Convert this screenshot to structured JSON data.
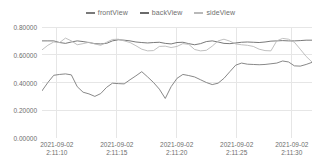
{
  "legend": {
    "position": "top-center",
    "items": [
      {
        "label": "frontView",
        "color": "#7a7a7a",
        "icon": "line-swatch-icon"
      },
      {
        "label": "backView",
        "color": "#6a6a6a",
        "icon": "line-swatch-icon"
      },
      {
        "label": "sideView",
        "color": "#b9b9b9",
        "icon": "line-swatch-icon"
      }
    ]
  },
  "axes": {
    "y_ticks": [
      "0.80000",
      "0.60000",
      "0.40000",
      "0.20000",
      "0.00000"
    ],
    "y_values": [
      0.8,
      0.6,
      0.4,
      0.2,
      0.0
    ],
    "x_ticks": [
      {
        "date": "2021-09-02",
        "time": "2:11:10"
      },
      {
        "date": "2021-09-02",
        "time": "2:11:15"
      },
      {
        "date": "2021-09-02",
        "time": "2:11:20"
      },
      {
        "date": "2021-09-02",
        "time": "2:11:25"
      },
      {
        "date": "2021-09-02",
        "time": "2:11:30"
      }
    ]
  },
  "style": {
    "grid_color": "#e6e6e6",
    "axis_color": "#d8d8d8",
    "text_color": "#6e6e6e",
    "background": "#ffffff"
  },
  "chart_data": {
    "type": "line",
    "title": "",
    "xlabel": "",
    "ylabel": "",
    "ylim": [
      0.0,
      0.8
    ],
    "grid": true,
    "legend_position": "top-center",
    "x_tick_labels": [
      "2021-09-02 2:11:10",
      "2021-09-02 2:11:15",
      "2021-09-02 2:11:20",
      "2021-09-02 2:11:25",
      "2021-09-02 2:11:30"
    ],
    "x_tick_positions": [
      0.055,
      0.277,
      0.499,
      0.721,
      0.925
    ],
    "series": [
      {
        "name": "frontView",
        "color": "#7a7a7a",
        "values": [
          0.34,
          0.4,
          0.452,
          0.458,
          0.462,
          0.455,
          0.37,
          0.33,
          0.318,
          0.3,
          0.32,
          0.365,
          0.395,
          0.392,
          0.39,
          0.42,
          0.448,
          0.478,
          0.44,
          0.4,
          0.352,
          0.285,
          0.37,
          0.43,
          0.458,
          0.45,
          0.44,
          0.42,
          0.4,
          0.385,
          0.395,
          0.43,
          0.478,
          0.525,
          0.54,
          0.532,
          0.53,
          0.528,
          0.53,
          0.535,
          0.54,
          0.555,
          0.548,
          0.52,
          0.518,
          0.53,
          0.545
        ]
      },
      {
        "name": "backView",
        "color": "#6a6a6a",
        "values": [
          0.7,
          0.7,
          0.7,
          0.688,
          0.682,
          0.692,
          0.7,
          0.695,
          0.688,
          0.68,
          0.678,
          0.682,
          0.7,
          0.708,
          0.705,
          0.7,
          0.692,
          0.688,
          0.685,
          0.688,
          0.69,
          0.682,
          0.678,
          0.688,
          0.69,
          0.68,
          0.672,
          0.68,
          0.695,
          0.7,
          0.692,
          0.682,
          0.68,
          0.685,
          0.69,
          0.692,
          0.69,
          0.688,
          0.692,
          0.698,
          0.7,
          0.702,
          0.7,
          0.7,
          0.702,
          0.705,
          0.705
        ]
      },
      {
        "name": "sideView",
        "color": "#b9b9b9",
        "values": [
          0.635,
          0.668,
          0.692,
          0.688,
          0.72,
          0.7,
          0.672,
          0.68,
          0.69,
          0.678,
          0.668,
          0.69,
          0.71,
          0.712,
          0.7,
          0.688,
          0.665,
          0.64,
          0.628,
          0.63,
          0.66,
          0.662,
          0.652,
          0.66,
          0.68,
          0.675,
          0.638,
          0.628,
          0.632,
          0.662,
          0.7,
          0.712,
          0.698,
          0.678,
          0.672,
          0.668,
          0.66,
          0.64,
          0.63,
          0.628,
          0.7,
          0.718,
          0.712,
          0.69,
          0.64,
          0.588,
          0.548
        ]
      }
    ]
  }
}
